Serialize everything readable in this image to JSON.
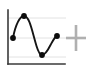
{
  "icon": {
    "name": "curve-fit-plus-icon",
    "description": "Small chart thumbnail showing a wavy data curve with four marked points and a plus crosshair",
    "background_color": "#ffffff",
    "width": 87,
    "height": 74
  },
  "axes": {
    "color": "#3a3a3a",
    "stroke_width": 1.6,
    "y_axis": {
      "x": 8,
      "y_top": 10,
      "y_bottom": 64
    },
    "x_axis": {
      "y": 64,
      "x_left": 8,
      "x_right": 65
    }
  },
  "gridlines": {
    "color": "#e2e2e2",
    "stroke_width": 1,
    "y_values": [
      18,
      38,
      57
    ],
    "x_left": 9,
    "x_right": 66
  },
  "crosshair": {
    "label": "plus-marker",
    "color": "#b0b0b0",
    "center_x": 76,
    "center_y": 38,
    "half_width": 10,
    "half_height": 13,
    "stroke_width": 2.6
  },
  "chart_data": {
    "type": "line",
    "title": "",
    "subtitle": "",
    "xlabel": "",
    "ylabel": "",
    "grid": true,
    "legend": null,
    "legend_position": "none",
    "xlim": [
      0,
      1
    ],
    "ylim": [
      0,
      1
    ],
    "axis_ticks": [],
    "tick_labels": [],
    "annotations": [],
    "series": [
      {
        "name": "curve",
        "color": "#151515",
        "line_width": 1.9,
        "marker": "circle",
        "marker_color": "#0d0d0d",
        "marker_radius": 2.9,
        "points_px": [
          {
            "x": 13,
            "y": 38
          },
          {
            "x": 24,
            "y": 16
          },
          {
            "x": 42,
            "y": 55
          },
          {
            "x": 57,
            "y": 36
          }
        ],
        "x": [
          0.088,
          0.281,
          0.596,
          0.86
        ],
        "values": [
          0.481,
          0.889,
          0.167,
          0.519
        ],
        "path_d": "M 13 38 C 15.5 24.5, 20 16, 24 16 C 29.5 16, 32 31, 36.5 46 C 38.5 52.5, 40 55, 42 55 C 45 55, 47.5 51, 50.5 45 C 53.5 39.5, 55 36.5, 57 36"
      }
    ]
  }
}
